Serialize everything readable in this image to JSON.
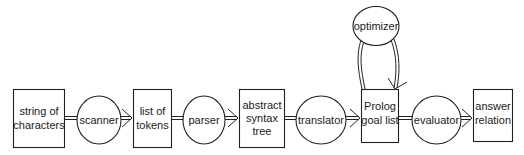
{
  "diagram": {
    "title": "",
    "nodes": [
      {
        "id": "string_of_characters",
        "shape": "box",
        "lines": [
          "string of",
          "characters"
        ]
      },
      {
        "id": "scanner",
        "shape": "ellipse",
        "lines": [
          "scanner"
        ]
      },
      {
        "id": "list_of_tokens",
        "shape": "box",
        "lines": [
          "list of",
          "tokens"
        ]
      },
      {
        "id": "parser",
        "shape": "ellipse",
        "lines": [
          "parser"
        ]
      },
      {
        "id": "abstract_syntax_tree",
        "shape": "box",
        "lines": [
          "abstract",
          "syntax",
          "tree"
        ]
      },
      {
        "id": "translator",
        "shape": "ellipse",
        "lines": [
          "translator"
        ]
      },
      {
        "id": "prolog_goal_list",
        "shape": "box",
        "lines": [
          "Prolog",
          "goal list"
        ]
      },
      {
        "id": "optimizer",
        "shape": "ellipse",
        "lines": [
          "optimizer"
        ]
      },
      {
        "id": "evaluator",
        "shape": "ellipse",
        "lines": [
          "evaluator"
        ]
      },
      {
        "id": "answer_relation",
        "shape": "box",
        "lines": [
          "answer",
          "relation"
        ]
      }
    ],
    "edges": [
      {
        "from": "string_of_characters",
        "to": "scanner",
        "arrow": false
      },
      {
        "from": "scanner",
        "to": "list_of_tokens",
        "arrow": true
      },
      {
        "from": "list_of_tokens",
        "to": "parser",
        "arrow": false
      },
      {
        "from": "parser",
        "to": "abstract_syntax_tree",
        "arrow": true
      },
      {
        "from": "abstract_syntax_tree",
        "to": "translator",
        "arrow": false
      },
      {
        "from": "translator",
        "to": "prolog_goal_list",
        "arrow": true
      },
      {
        "from": "prolog_goal_list",
        "to": "optimizer",
        "arrow": false
      },
      {
        "from": "optimizer",
        "to": "prolog_goal_list",
        "arrow": true
      },
      {
        "from": "prolog_goal_list",
        "to": "evaluator",
        "arrow": false
      },
      {
        "from": "evaluator",
        "to": "answer_relation",
        "arrow": true
      }
    ],
    "colors": {
      "stroke": "#222222",
      "fill": "#ffffff",
      "text": "#1a1a1a"
    }
  }
}
